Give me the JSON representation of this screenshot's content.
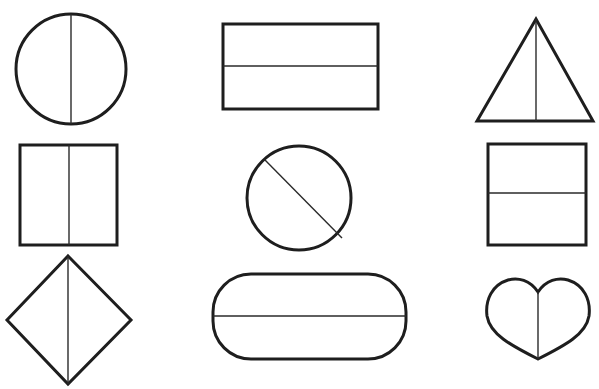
{
  "title": "Shapes divided into two equal parts",
  "colors": {
    "stroke": "#1e1e1e",
    "background": "#ffffff"
  },
  "shapes": [
    {
      "name": "circle",
      "division": "vertical",
      "row": 1,
      "col": 1
    },
    {
      "name": "rectangle",
      "division": "horizontal",
      "row": 1,
      "col": 2
    },
    {
      "name": "triangle",
      "division": "vertical",
      "row": 1,
      "col": 3
    },
    {
      "name": "square",
      "division": "vertical",
      "row": 2,
      "col": 1
    },
    {
      "name": "circle",
      "division": "diagonal",
      "row": 2,
      "col": 2
    },
    {
      "name": "square",
      "division": "horizontal",
      "row": 2,
      "col": 3
    },
    {
      "name": "diamond",
      "division": "vertical",
      "row": 3,
      "col": 1
    },
    {
      "name": "rounded-rectangle",
      "division": "horizontal",
      "row": 3,
      "col": 2
    },
    {
      "name": "heart",
      "division": "vertical",
      "row": 3,
      "col": 3
    }
  ]
}
